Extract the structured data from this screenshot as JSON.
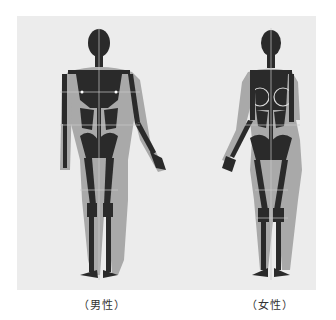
{
  "figures": [
    {
      "id": "male",
      "caption": "（男性）"
    },
    {
      "id": "female",
      "caption": "（女性）"
    }
  ],
  "colors": {
    "background": "#ffffff",
    "panel": "#ececec",
    "body_silhouette": "#a9a9a9",
    "bone_segments": "#2a2a2a",
    "guide_lines": "#c8c8c8"
  }
}
